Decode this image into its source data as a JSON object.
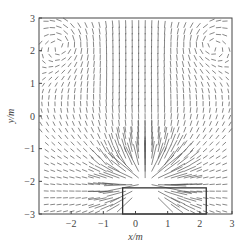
{
  "chart_data": {
    "type": "quiver",
    "title": "",
    "xlabel": "x/m",
    "ylabel": "y/m",
    "xlim": [
      -3,
      3
    ],
    "ylim": [
      -3,
      3
    ],
    "xticks": [
      -2,
      -1,
      0,
      1,
      2,
      3
    ],
    "yticks": [
      -3,
      -2,
      -1,
      0,
      1,
      2,
      3
    ],
    "xtick_labels": [
      "−2",
      "−1",
      "0",
      "1",
      "2",
      "3"
    ],
    "ytick_labels": [
      "−3",
      "−2",
      "−1",
      "0",
      "1",
      "2",
      "3"
    ],
    "grid": false,
    "legend": null,
    "source_point": {
      "x": 0.3,
      "y": -2.05
    },
    "rectangle": {
      "x0": -0.4,
      "x1": 2.2,
      "y0": -3.0,
      "y1": -2.2
    },
    "field_description": "Vector field radiating outward from a source near (0.3, -2.05); vertical parallel vectors in central column (x≈-1 to 1) at top; circulating vortex patterns at upper-left and upper-right corners",
    "colors": {
      "arrows": "#555555",
      "axes": "#444444"
    }
  }
}
